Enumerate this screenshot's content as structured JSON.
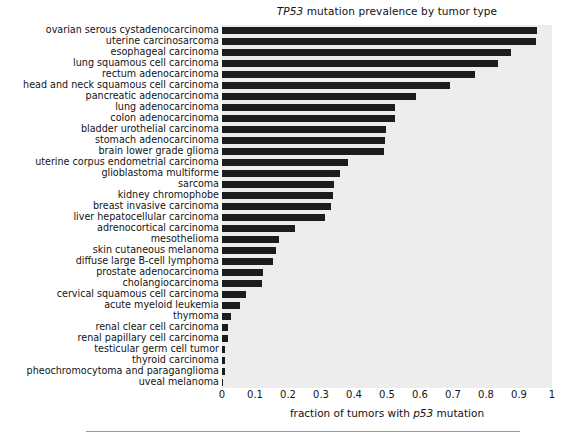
{
  "figure": {
    "title_prefix": "TP53",
    "title_rest": " mutation prevalence by tumor type",
    "xlabel_prefix": "fraction of tumors with ",
    "xlabel_gene": "p53",
    "xlabel_suffix": " mutation",
    "bar_color": "#1c1c1c",
    "plot_background": "#ededed",
    "page_background": "#ffffff"
  },
  "chart_data": {
    "type": "bar",
    "orientation": "horizontal",
    "title": "TP53 mutation prevalence by tumor type",
    "xlabel": "fraction of tumors with p53 mutation",
    "ylabel": "",
    "xlim": [
      0,
      1
    ],
    "grid": false,
    "legend": false,
    "xticks": [
      "0",
      "0.1",
      "0.2",
      "0.3",
      "0.4",
      "0.5",
      "0.6",
      "0.7",
      "0.8",
      "0.9",
      "1"
    ],
    "xtick_values": [
      0,
      0.1,
      0.2,
      0.3,
      0.4,
      0.5,
      0.6,
      0.7,
      0.8,
      0.9,
      1
    ],
    "categories": [
      "ovarian serous cystadenocarcinoma",
      "uterine carcinosarcoma",
      "esophageal carcinoma",
      "lung squamous cell carcinoma",
      "rectum adenocarcinoma",
      "head and neck squamous cell carcinoma",
      "pancreatic adenocarcinoma",
      "lung adenocarcinoma",
      "colon adenocarcinoma",
      "bladder urothelial carcinoma",
      "stomach adenocarcinoma",
      "brain lower grade glioma",
      "uterine corpus endometrial carcinoma",
      "glioblastoma multiforme",
      "sarcoma",
      "kidney chromophobe",
      "breast invasive carcinoma",
      "liver hepatocellular carcinoma",
      "adrenocortical carcinoma",
      "mesothelioma",
      "skin cutaneous melanoma",
      "diffuse large B-cell lymphoma",
      "prostate adenocarcinoma",
      "cholangiocarcinoma",
      "cervical squamous cell carcinoma",
      "acute myeloid leukemia",
      "thymoma",
      "renal clear cell carcinoma",
      "renal papillary cell carcinoma",
      "testicular germ cell tumor",
      "thyroid carcinoma",
      "pheochromocytoma and paraganglioma",
      "uveal melanoma"
    ],
    "values": [
      0.955,
      0.951,
      0.877,
      0.836,
      0.768,
      0.691,
      0.587,
      0.525,
      0.524,
      0.498,
      0.494,
      0.491,
      0.383,
      0.358,
      0.34,
      0.336,
      0.33,
      0.312,
      0.222,
      0.173,
      0.164,
      0.154,
      0.123,
      0.12,
      0.074,
      0.056,
      0.028,
      0.019,
      0.019,
      0.009,
      0.008,
      0.008,
      0.002
    ]
  }
}
